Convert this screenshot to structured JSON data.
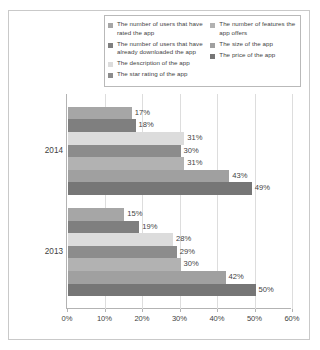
{
  "chart_data": {
    "type": "bar",
    "orientation": "horizontal",
    "title": "",
    "xlabel": "",
    "ylabel": "",
    "xlim": [
      0,
      60
    ],
    "xtick_labels": [
      "0%",
      "10%",
      "20%",
      "30%",
      "40%",
      "50%",
      "60%"
    ],
    "xtick_values": [
      0,
      10,
      20,
      30,
      40,
      50,
      60
    ],
    "grid": true,
    "legend_position": "top",
    "categories": [
      "2014",
      "2013"
    ],
    "series": [
      {
        "name": "The number of users that have rated the app",
        "short": "users-rated",
        "color": "#a6a6a6",
        "values": [
          17,
          15
        ],
        "labels": [
          "17%",
          "15%"
        ]
      },
      {
        "name": "The number of users that have already downloaded the app",
        "short": "users-downloaded",
        "color": "#7f7f7f",
        "values": [
          18,
          19
        ],
        "labels": [
          "18%",
          "19%"
        ]
      },
      {
        "name": "The description of the app",
        "short": "description",
        "color": "#dcdcdc",
        "values": [
          31,
          28
        ],
        "labels": [
          "31%",
          "28%"
        ]
      },
      {
        "name": "The star rating of the app",
        "short": "star-rating",
        "color": "#8c8c8c",
        "values": [
          30,
          29
        ],
        "labels": [
          "30%",
          "29%"
        ]
      },
      {
        "name": "The number of features the app offers",
        "short": "features",
        "color": "#b2b2b2",
        "values": [
          31,
          30
        ],
        "labels": [
          "31%",
          "30%"
        ]
      },
      {
        "name": "The size of the app",
        "short": "size",
        "color": "#a0a0a0",
        "values": [
          43,
          42
        ],
        "labels": [
          "43%",
          "42%"
        ]
      },
      {
        "name": "The price of the app",
        "short": "price",
        "color": "#767676",
        "values": [
          49,
          50
        ],
        "labels": [
          "49%",
          "50%"
        ]
      }
    ]
  },
  "legend": {
    "left_column": [
      {
        "label": "The number of users that have rated the app",
        "color": "#a6a6a6"
      },
      {
        "label": "The number of users that have already downloaded the app",
        "color": "#7f7f7f"
      },
      {
        "label": "The description of the app",
        "color": "#dcdcdc"
      },
      {
        "label": "The star rating of the app",
        "color": "#8c8c8c"
      }
    ],
    "right_column": [
      {
        "label": "The number of features the app offers",
        "color": "#b2b2b2"
      },
      {
        "label": "The size of the app",
        "color": "#a0a0a0"
      },
      {
        "label": "The price of the app",
        "color": "#767676"
      }
    ]
  },
  "axis": {
    "group_labels": [
      "2014",
      "2013"
    ],
    "x_labels": [
      "0%",
      "10%",
      "20%",
      "30%",
      "40%",
      "50%",
      "60%"
    ]
  }
}
